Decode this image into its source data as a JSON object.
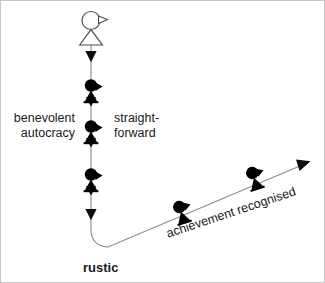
{
  "diagram": {
    "title": "rustic",
    "background_color": "#ffffff",
    "stroke_color": "#808080",
    "figure_color": "#000000",
    "text_color": "#1a1a1a",
    "labels": {
      "left": "benevolent\nautocracy",
      "right": "straight-\nforward",
      "bottom": "rustic",
      "diagonal": "achievement recognised"
    },
    "vertical_axis": {
      "name": "downward-flow-line",
      "x": 90,
      "top_y": 46,
      "bottom_y": 240,
      "arrowheads_y": [
        58,
        216
      ],
      "figure_positions_y": [
        93,
        133,
        181
      ]
    },
    "diagonal_axis": {
      "name": "rising-arrow-line",
      "start": [
        100,
        248
      ],
      "end": [
        308,
        161
      ],
      "angle_degrees": -18.5,
      "figure_positions": [
        [
          180,
          212
        ],
        [
          253,
          177
        ]
      ]
    },
    "outline_figure": {
      "name": "outline-person",
      "head_center": [
        90,
        19
      ],
      "head_radius": 9,
      "body_top_y": 28,
      "body_bottom_y": 44,
      "filled": false
    }
  },
  "figures": {
    "outline_count": 1,
    "filled_vertical_count": 3,
    "filled_diagonal_count": 2
  }
}
